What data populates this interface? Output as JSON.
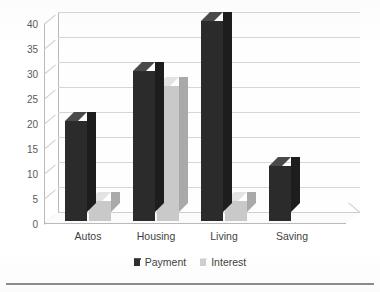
{
  "chart_data": {
    "type": "bar",
    "title": "",
    "subtitle": "",
    "xlabel": "",
    "ylabel": "",
    "categories": [
      "Autos",
      "Housing",
      "Living",
      "Saving"
    ],
    "series": [
      {
        "name": "Payment",
        "values": [
          20,
          30,
          40,
          11
        ],
        "color": "#2b2b2b"
      },
      {
        "name": "Interest",
        "values": [
          4,
          27,
          4,
          0
        ],
        "color": "#c9c9c9"
      }
    ],
    "ylim": [
      0,
      40
    ],
    "yticks": [
      40,
      35,
      30,
      25,
      20,
      15,
      10,
      5,
      0
    ],
    "ytick_labels": [
      "40",
      "35",
      "30",
      "25",
      "20",
      "15",
      "10",
      "5",
      "0"
    ],
    "grid": true,
    "grid_axis": "y",
    "legend_position": "bottom",
    "style": "3d-clustered-column"
  },
  "legend": {
    "items": [
      {
        "label": "Payment",
        "swatch": "dark-square-swatch"
      },
      {
        "label": "Interest",
        "swatch": "light-square-swatch"
      }
    ]
  },
  "colors": {
    "payment": "#2b2b2b",
    "interest": "#c9c9c9",
    "gridline": "#d6d6d6",
    "axis": "#b9b9b9",
    "text": "#3f3f3f",
    "rule": "#8d8d8d",
    "background": "#ffffff"
  }
}
